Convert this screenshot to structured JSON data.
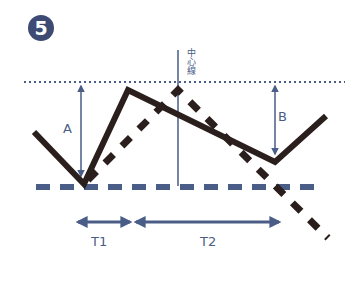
{
  "badge": {
    "number": "5",
    "color": "#3c4a74"
  },
  "labels": {
    "a": "A",
    "b": "B",
    "t1": "T1",
    "t2": "T2",
    "center_line": "中心線"
  },
  "colors": {
    "price_line": "#2a1f1c",
    "guide": "#4a5d86",
    "dotted": "#4a5d86",
    "dashed_base": "#4a5d86"
  },
  "lines": {
    "price_solid": [
      [
        34,
        132
      ],
      [
        84,
        184
      ],
      [
        128,
        90
      ],
      [
        275,
        162
      ],
      [
        326,
        116
      ]
    ],
    "price_dashed": [
      [
        84,
        184
      ],
      [
        178,
        90
      ],
      [
        328,
        236
      ]
    ],
    "top_dotted_y": 82,
    "base_dashed_y": 187,
    "center_x": 178
  }
}
